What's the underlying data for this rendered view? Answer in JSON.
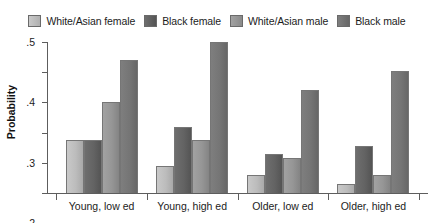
{
  "chart_data": {
    "type": "bar",
    "title": "",
    "xlabel": "",
    "ylabel": "Probability",
    "ylim": [
      0,
      0.5
    ],
    "ytick_labels": [
      ".0",
      ".1",
      ".2",
      ".3",
      ".4",
      ".5"
    ],
    "ytick_values": [
      0.0,
      0.1,
      0.2,
      0.3,
      0.4,
      0.5
    ],
    "grid": false,
    "legend_position": "top",
    "categories": [
      "Young, low ed",
      "Young, high ed",
      "Older, low ed",
      "Older, high ed"
    ],
    "series": [
      {
        "name": "White/Asian female",
        "color": "#c2c2c2",
        "values": [
          0.175,
          0.09,
          0.06,
          0.03
        ]
      },
      {
        "name": "Black female",
        "color": "#636363",
        "values": [
          0.175,
          0.22,
          0.13,
          0.155
        ]
      },
      {
        "name": "White/Asian male",
        "color": "#969696",
        "values": [
          0.3,
          0.175,
          0.115,
          0.06
        ]
      },
      {
        "name": "Black male",
        "color": "#757575",
        "values": [
          0.44,
          0.5,
          0.34,
          0.405
        ]
      }
    ]
  }
}
